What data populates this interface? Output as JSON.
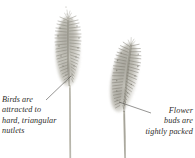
{
  "figure": {
    "background_color": "#ffffff",
    "width": 195,
    "height": 158
  },
  "illustration": {
    "style": "watercolor-pencil botanical specimen",
    "ink_color": "#3a3833",
    "specimens": [
      {
        "name": "left-flower-spike",
        "description": "dense cylindrical flower spike with tightly packed bracts on a slender vertical stem",
        "tilt_degrees": -4,
        "spike_color_dark": "#86857c",
        "spike_color_mid": "#a6a49a",
        "spike_color_light": "#c9c7bd",
        "stem_color": "#b0aea3"
      },
      {
        "name": "right-flower-spike",
        "description": "dense cylindrical flower spike angled to the left with tightly packed bracts on a slender stem",
        "tilt_degrees": 10,
        "spike_color_dark": "#7e7d75",
        "spike_color_mid": "#a3a198",
        "spike_color_light": "#c6c4ba",
        "stem_color": "#aeaca1"
      }
    ]
  },
  "annotations": {
    "left": {
      "id": "birds-nutlets-caption",
      "lines": [
        "Birds are",
        "attracted to",
        "hard, triangular",
        "nutlets"
      ],
      "text_color": "#2e2c2a",
      "leader_line": {
        "from_x": 46,
        "from_y": 100,
        "to_x": 71,
        "to_y": 76,
        "color": "#4a4845"
      }
    },
    "right": {
      "id": "flower-buds-caption",
      "lines": [
        "Flower",
        "buds are",
        "tightly packed"
      ],
      "text_color": "#2e2c2a",
      "leader_line": {
        "from_x": 119,
        "from_y": 102,
        "to_x": 151,
        "to_y": 113,
        "color": "#4a4845"
      }
    }
  }
}
